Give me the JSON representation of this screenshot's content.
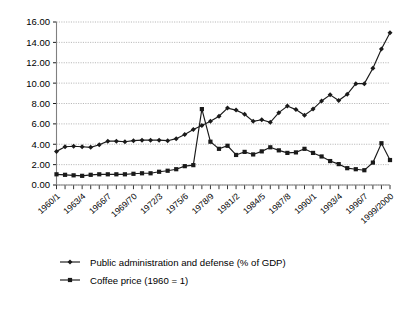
{
  "chart_data": {
    "type": "line",
    "title": "",
    "xlabel": "",
    "ylabel": "",
    "ylim": [
      0,
      16
    ],
    "ytick_step": 2,
    "grid": true,
    "legend_position": "bottom-left",
    "ytick_labels": [
      "0.00",
      "2.00",
      "4.00",
      "6.00",
      "8.00",
      "10.00",
      "12.00",
      "14.00",
      "16.00"
    ],
    "x": [
      "1960/1",
      "1961/2",
      "1962/3",
      "1963/4",
      "1964/5",
      "1965/6",
      "1966/7",
      "1967/8",
      "1968/9",
      "1969/70",
      "1970/1",
      "1971/2",
      "1972/3",
      "1973/4",
      "1974/5",
      "1975/6",
      "1976/7",
      "1977/8",
      "1978/9",
      "1979/80",
      "1980/1",
      "1981/2",
      "1982/3",
      "1983/4",
      "1984/5",
      "1985/6",
      "1986/7",
      "1987/8",
      "1988/9",
      "1989/90",
      "1990/1",
      "1991/2",
      "1992/3",
      "1993/4",
      "1994/5",
      "1995/6",
      "1996/7",
      "1997/8",
      "1998/9",
      "1999/2000"
    ],
    "xtick_labels": [
      "1960/1",
      "1963/4",
      "1966/7",
      "1969/70",
      "1972/3",
      "1975/6",
      "1978/9",
      "1981/2",
      "1984/5",
      "1987/8",
      "1990/1",
      "1993/4",
      "1996/7",
      "1999/2000"
    ],
    "xtick_indices": [
      0,
      3,
      6,
      9,
      12,
      15,
      18,
      21,
      24,
      27,
      30,
      33,
      36,
      39
    ],
    "series": [
      {
        "name": "Public administration and defense (% of GDP)",
        "marker": "diamond",
        "color": "#1a1a1a",
        "values": [
          3.3,
          3.75,
          3.8,
          3.75,
          3.7,
          3.95,
          4.3,
          4.3,
          4.25,
          4.35,
          4.4,
          4.4,
          4.4,
          4.35,
          4.55,
          4.95,
          5.45,
          5.85,
          6.25,
          6.75,
          7.55,
          7.35,
          6.95,
          6.25,
          6.4,
          6.15,
          7.1,
          7.75,
          7.4,
          6.85,
          7.45,
          8.25,
          8.85,
          8.3,
          8.9,
          9.95,
          9.95,
          11.45,
          13.35,
          14.95
        ]
      },
      {
        "name": "Coffee price (1960 = 1)",
        "marker": "square",
        "color": "#5a5a5a",
        "values": [
          1.05,
          1.0,
          0.95,
          0.9,
          1.0,
          1.05,
          1.05,
          1.05,
          1.05,
          1.1,
          1.15,
          1.15,
          1.3,
          1.4,
          1.55,
          1.85,
          1.95,
          7.45,
          4.25,
          3.55,
          3.85,
          2.95,
          3.25,
          3.0,
          3.3,
          3.7,
          3.4,
          3.15,
          3.2,
          3.55,
          3.15,
          2.8,
          2.35,
          2.05,
          1.65,
          1.55,
          1.45,
          2.2,
          4.1,
          2.45
        ]
      }
    ],
    "legend": [
      {
        "label": "Public administration and defense (% of GDP)",
        "marker": "diamond"
      },
      {
        "label": "Coffee price (1960 = 1)",
        "marker": "square"
      }
    ]
  }
}
